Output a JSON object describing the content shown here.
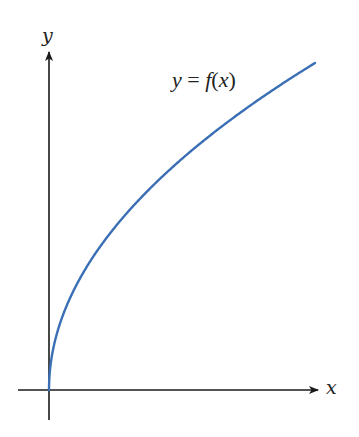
{
  "chart_data": {
    "type": "line",
    "title": "",
    "annotation": "y = f(x)",
    "xlabel": "x",
    "ylabel": "y",
    "grid": false,
    "legend": "none",
    "axes": {
      "origin_px": [
        49,
        390
      ],
      "x_axis_px": {
        "start": 18,
        "end": 318
      },
      "y_axis_px": {
        "start": 420,
        "end": 52
      },
      "ticks": "none"
    },
    "series": [
      {
        "name": "f(x)",
        "color": "#3a6fb5",
        "form": "y = k * sqrt(x)",
        "k": 20.05,
        "x": [
          0,
          1,
          4,
          9,
          16,
          31,
          64,
          100,
          144,
          196,
          266
        ],
        "values": [
          0,
          20.05,
          40.1,
          60.15,
          80.2,
          111.6,
          160.4,
          200.5,
          240.6,
          280.7,
          327
        ]
      }
    ]
  },
  "labels": {
    "y_axis": "y",
    "x_axis": "x",
    "annotation_y": "y",
    "annotation_eq": " = ",
    "annotation_f": "f",
    "annotation_open": "(",
    "annotation_x": "x",
    "annotation_close": ")"
  },
  "colors": {
    "axis": "#1a1a1a",
    "curve": "#3a6fb5",
    "text": "#222222"
  }
}
